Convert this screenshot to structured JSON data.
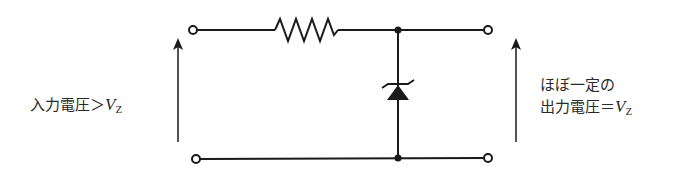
{
  "diagram": {
    "components": [
      {
        "id": "R",
        "type": "resistor",
        "name": "series-resistor"
      },
      {
        "id": "D",
        "type": "zener-diode",
        "name": "zener-diode",
        "orientation": "cathode-up"
      }
    ],
    "nodes": [
      "input-top",
      "input-bottom",
      "output-top",
      "output-bottom",
      "junction-top",
      "junction-bottom"
    ],
    "colors": {
      "line": "#1a1a1a",
      "text": "#2a2a2a",
      "background": "#ffffff"
    }
  },
  "labels": {
    "input": {
      "text": "入力電圧＞",
      "symbol": "V",
      "subscript": "Z"
    },
    "output": {
      "line1": "ほぼ一定の",
      "line2_text": "出力電圧＝",
      "symbol": "V",
      "subscript": "Z"
    }
  }
}
